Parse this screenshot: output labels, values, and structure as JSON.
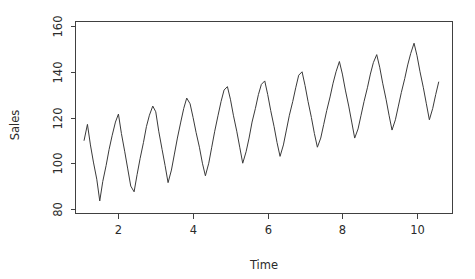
{
  "chart_data": {
    "type": "line",
    "title": "",
    "subtitle": "",
    "xlabel": "Time",
    "ylabel": "Sales",
    "xlim": [
      0.85,
      10.95
    ],
    "ylim": [
      78,
      162
    ],
    "xticks": [
      2,
      4,
      6,
      8,
      10
    ],
    "yticks": [
      80,
      100,
      120,
      140,
      160
    ],
    "xtick_labels": [
      "2",
      "4",
      "6",
      "8",
      "10"
    ],
    "ytick_labels": [
      "80",
      "100",
      "120",
      "140",
      "160"
    ],
    "grid": false,
    "legend": null,
    "legend_position": "none",
    "box": "full",
    "series": [
      {
        "name": "Sales",
        "color": "#3a3a3a",
        "x": [
          1.08,
          1.17,
          1.25,
          1.33,
          1.42,
          1.5,
          1.58,
          1.67,
          1.75,
          1.83,
          1.92,
          2.0,
          2.08,
          2.17,
          2.25,
          2.33,
          2.42,
          2.5,
          2.58,
          2.67,
          2.75,
          2.83,
          2.92,
          3.0,
          3.08,
          3.17,
          3.25,
          3.33,
          3.42,
          3.5,
          3.58,
          3.67,
          3.75,
          3.83,
          3.92,
          4.0,
          4.08,
          4.17,
          4.25,
          4.33,
          4.42,
          4.5,
          4.58,
          4.67,
          4.75,
          4.83,
          4.92,
          5.0,
          5.08,
          5.17,
          5.25,
          5.33,
          5.42,
          5.5,
          5.58,
          5.67,
          5.75,
          5.83,
          5.92,
          6.0,
          6.08,
          6.17,
          6.25,
          6.33,
          6.42,
          6.5,
          6.58,
          6.67,
          6.75,
          6.83,
          6.92,
          7.0,
          7.08,
          7.17,
          7.25,
          7.33,
          7.42,
          7.5,
          7.58,
          7.67,
          7.75,
          7.83,
          7.92,
          8.0,
          8.08,
          8.17,
          8.25,
          8.33,
          8.42,
          8.5,
          8.58,
          8.67,
          8.75,
          8.83,
          8.92,
          9.0,
          9.08,
          9.17,
          9.25,
          9.33,
          9.42,
          9.5,
          9.58,
          9.67,
          9.75,
          9.83,
          9.92,
          10.0,
          10.08,
          10.17,
          10.25,
          10.33,
          10.42,
          10.5,
          10.58
        ],
        "y": [
          110.0,
          117.0,
          108.0,
          100.5,
          93.0,
          83.5,
          92.0,
          99.0,
          106.0,
          112.0,
          118.0,
          121.5,
          113.0,
          105.0,
          97.5,
          90.0,
          87.5,
          95.0,
          102.0,
          109.0,
          116.0,
          121.0,
          125.0,
          122.5,
          114.0,
          106.0,
          99.0,
          91.5,
          97.0,
          104.0,
          111.0,
          118.0,
          124.0,
          128.5,
          126.0,
          120.0,
          113.5,
          107.0,
          100.0,
          94.5,
          100.0,
          107.0,
          114.0,
          121.0,
          127.0,
          132.0,
          133.5,
          128.0,
          121.0,
          114.0,
          107.0,
          100.0,
          105.0,
          111.0,
          118.0,
          124.0,
          130.0,
          134.5,
          136.0,
          130.0,
          123.0,
          116.0,
          109.0,
          103.0,
          108.0,
          114.5,
          121.0,
          127.0,
          133.0,
          138.5,
          140.0,
          134.0,
          127.0,
          120.0,
          113.0,
          107.0,
          111.0,
          117.0,
          123.0,
          129.0,
          135.0,
          140.0,
          144.5,
          139.0,
          132.0,
          125.0,
          118.0,
          111.0,
          115.0,
          121.0,
          127.0,
          133.0,
          139.0,
          144.0,
          147.5,
          142.0,
          135.0,
          128.0,
          121.0,
          114.5,
          119.0,
          125.0,
          131.0,
          137.0,
          143.0,
          148.0,
          152.5,
          147.0,
          140.0,
          133.0,
          126.0,
          119.0,
          124.0,
          130.0,
          135.5
        ]
      }
    ]
  },
  "labels": {
    "ylabel": "Sales",
    "xlabel": "Time"
  }
}
